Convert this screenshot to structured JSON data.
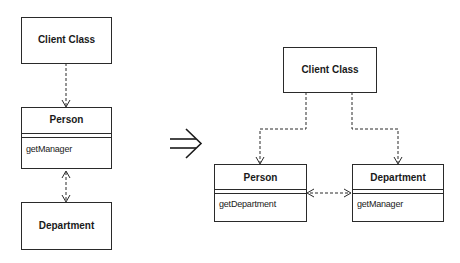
{
  "before": {
    "client": {
      "name": "Client Class"
    },
    "person": {
      "name": "Person",
      "methods": [
        "getManager"
      ]
    },
    "department": {
      "name": "Department"
    }
  },
  "transform_arrow": {
    "glyph": "⇒",
    "meaning": "refactors-to"
  },
  "after": {
    "client": {
      "name": "Client Class"
    },
    "person": {
      "name": "Person",
      "methods": [
        "getDepartment"
      ]
    },
    "department": {
      "name": "Department",
      "methods": [
        "getManager"
      ]
    }
  },
  "colors": {
    "line": "#2a2a2a",
    "background": "#ffffff"
  }
}
